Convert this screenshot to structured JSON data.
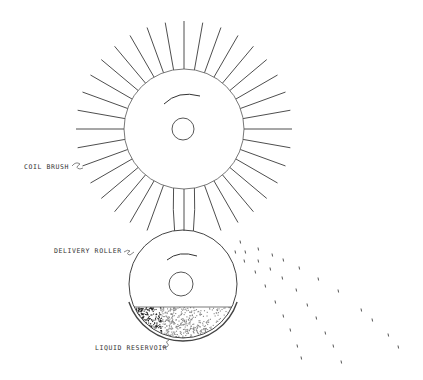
{
  "figure": {
    "labels": {
      "coil_brush": "COIL BRUSH",
      "delivery_roller": "DELIVERY ROLLER",
      "liquid_reservoir": "LIQUID RESERVOIR"
    },
    "colors": {
      "line": "#3a3a3a",
      "liquid_dark": "#222222",
      "liquid_light": "#888888",
      "background": "#ffffff"
    },
    "coil_brush": {
      "center": [
        184,
        129
      ],
      "hub_radius": 60,
      "bristle_outer_radius": 108,
      "bristle_count": 36,
      "axle_radius": 11,
      "rotation": "counter-clockwise"
    },
    "delivery_roller": {
      "center": [
        183,
        284
      ],
      "radius": 54,
      "axle_radius": 12,
      "rotation": "counter-clockwise"
    },
    "liquid_reservoir": {
      "liquid_level_y": 307,
      "bottom_y": 342
    },
    "spray_droplets": [
      [
        240,
        242
      ],
      [
        235,
        252
      ],
      [
        245,
        252
      ],
      [
        258,
        249
      ],
      [
        272,
        255
      ],
      [
        283,
        260
      ],
      [
        244,
        261
      ],
      [
        258,
        261
      ],
      [
        270,
        269
      ],
      [
        299,
        268
      ],
      [
        255,
        272
      ],
      [
        282,
        278
      ],
      [
        318,
        279
      ],
      [
        265,
        286
      ],
      [
        296,
        290
      ],
      [
        338,
        291
      ],
      [
        275,
        302
      ],
      [
        307,
        305
      ],
      [
        361,
        310
      ],
      [
        283,
        316
      ],
      [
        316,
        318
      ],
      [
        372,
        320
      ],
      [
        290,
        330
      ],
      [
        325,
        333
      ],
      [
        388,
        335
      ],
      [
        297,
        346
      ],
      [
        333,
        346
      ],
      [
        398,
        347
      ],
      [
        301,
        358
      ],
      [
        341,
        362
      ]
    ]
  }
}
